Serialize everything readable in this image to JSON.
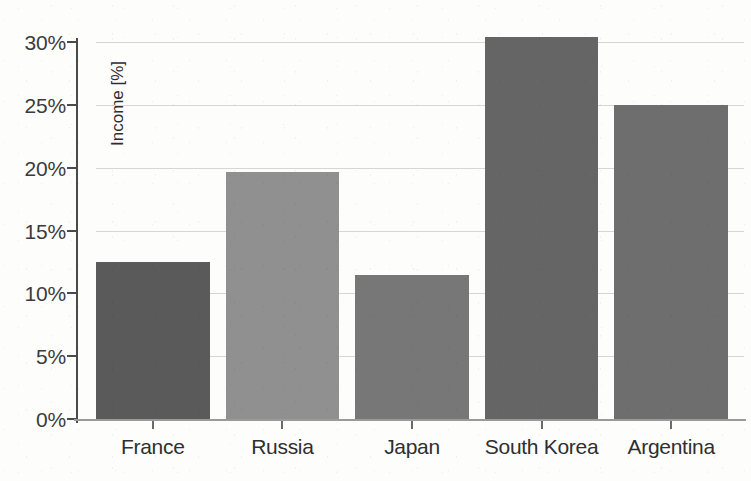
{
  "chart_data": {
    "type": "bar",
    "title": "",
    "subtitle": "",
    "xlabel": "",
    "ylabel": "Income [%]",
    "categories": [
      "France",
      "Russia",
      "Japan",
      "South Korea",
      "Argentina"
    ],
    "values": [
      12.5,
      19.7,
      11.5,
      30.4,
      25.0
    ],
    "series": [
      {
        "name": "Income",
        "values": [
          12.5,
          19.7,
          11.5,
          30.4,
          25.0
        ]
      }
    ],
    "bar_colors": [
      "#5a5a5a",
      "#909090",
      "#777777",
      "#656565",
      "#6e6e6e"
    ],
    "ylim": [
      0,
      31
    ],
    "ytick_values": [
      0,
      5,
      10,
      15,
      20,
      25,
      30
    ],
    "ytick_labels": [
      "0%",
      "5%",
      "10%",
      "15%",
      "20%",
      "25%",
      "30%"
    ],
    "grid": true,
    "grid_axis": "y",
    "legend": false,
    "legend_position": "none",
    "value_suffix": "%",
    "background_color": "#fdfdfc",
    "gridline_color": "#d6d6d4",
    "axis_color": "#4a4a4a",
    "text_color": "#2f2f2f"
  },
  "axes": {
    "y_axis_title": "Income [%]"
  }
}
